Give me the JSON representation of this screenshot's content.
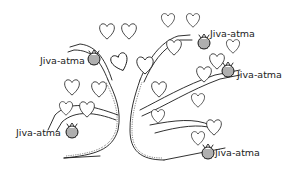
{
  "diagram": {
    "colors": {
      "line": "#1a1a1a",
      "background": "#ffffff",
      "text": "#222222"
    },
    "labels": [
      {
        "id": "top-left",
        "text": "Jiva-atma"
      },
      {
        "id": "top-right",
        "text": "Jiva-atma"
      },
      {
        "id": "mid-right",
        "text": "Jiva-atma"
      },
      {
        "id": "bottom-left",
        "text": "Jiva-atma"
      },
      {
        "id": "bottom-right",
        "text": "Jiva-atma"
      }
    ]
  }
}
